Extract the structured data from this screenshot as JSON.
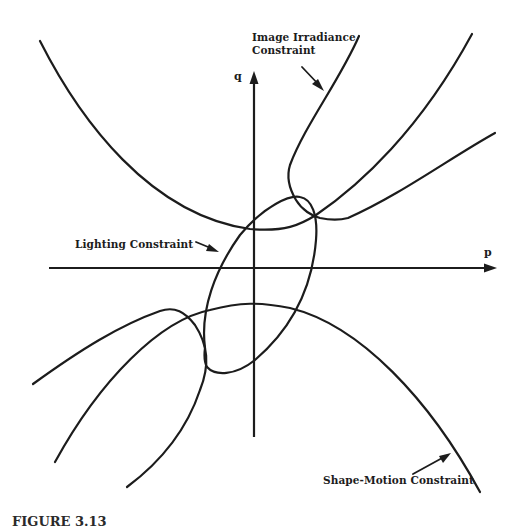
{
  "diagram": {
    "axes": {
      "horizontal_label": "p",
      "vertical_label": "q"
    },
    "labels": {
      "image_irradiance_line1": "Image Irradiance",
      "image_irradiance_line2": "Constraint",
      "lighting": "Lighting Constraint",
      "shape_motion": "Shape-Motion Constraint"
    },
    "caption": "FIGURE 3.13",
    "colors": {
      "ink": "#1c1c1c",
      "background": "#ffffff"
    }
  }
}
